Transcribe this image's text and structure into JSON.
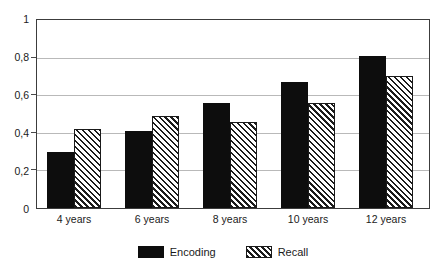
{
  "chart_data": {
    "type": "bar",
    "title": "",
    "xlabel": "",
    "ylabel": "",
    "ylim": [
      0,
      1
    ],
    "ytick_labels": [
      "1",
      "0,8",
      "0,6",
      "0,4",
      "0,2",
      "0"
    ],
    "ytick_values": [
      1,
      0.8,
      0.6,
      0.4,
      0.2,
      0
    ],
    "grid": true,
    "legend_position": "bottom-center",
    "categories": [
      "4 years",
      "6 years",
      "8 years",
      "10 years",
      "12 years"
    ],
    "series": [
      {
        "name": "Encoding",
        "color": "#0d0d0d",
        "fill": "solid",
        "values": [
          0.3,
          0.41,
          0.56,
          0.67,
          0.81
        ]
      },
      {
        "name": "Recall",
        "color": "#1c1c1c",
        "fill": "diagonal-hatch",
        "values": [
          0.42,
          0.49,
          0.46,
          0.56,
          0.7
        ]
      }
    ]
  }
}
